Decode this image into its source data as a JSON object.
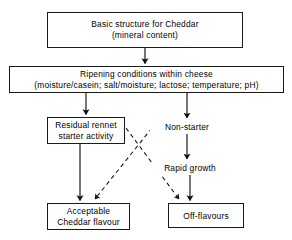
{
  "diagram": {
    "background_color": "#ffffff",
    "line_color": "#1a1a1a",
    "text_color": "#000000",
    "nodes": [
      {
        "id": "basic-structure",
        "line1": "Basic structure for Cheddar",
        "line2": "(mineral content)",
        "boxed": true
      },
      {
        "id": "ripening-conditions",
        "line1": "Ripening conditions within cheese",
        "line2": "(moisture/casein; salt/moisture; lactose; temperature; pH)",
        "boxed": true
      },
      {
        "id": "residual-rennet",
        "line1": "Residual rennet",
        "line2": "starter activity",
        "boxed": true
      },
      {
        "id": "non-starter",
        "line1": "Non-starter",
        "boxed": false
      },
      {
        "id": "rapid-growth",
        "line1": "Rapid growth",
        "boxed": false
      },
      {
        "id": "acceptable-flavour",
        "line1": "Acceptable",
        "line2": "Cheddar flavour",
        "boxed": true
      },
      {
        "id": "off-flavours",
        "line1": "Off-flavours",
        "boxed": true
      }
    ],
    "edges": [
      {
        "id": "basic-to-ripening",
        "from": "basic-structure",
        "to": "ripening-conditions",
        "style": "solid"
      },
      {
        "id": "ripening-to-residual",
        "from": "ripening-conditions",
        "to": "residual-rennet",
        "style": "solid"
      },
      {
        "id": "ripening-to-nonstarter",
        "from": "ripening-conditions",
        "to": "non-starter",
        "style": "solid"
      },
      {
        "id": "nonstarter-to-rapidgrowth",
        "from": "non-starter",
        "to": "rapid-growth",
        "style": "solid"
      },
      {
        "id": "residual-to-acceptable",
        "from": "residual-rennet",
        "to": "acceptable-flavour",
        "style": "solid"
      },
      {
        "id": "rapidgrowth-to-offflavours",
        "from": "rapid-growth",
        "to": "off-flavours",
        "style": "solid"
      },
      {
        "id": "residual-to-offflavours",
        "from": "residual-rennet",
        "to": "off-flavours",
        "style": "dashed"
      },
      {
        "id": "nonstarter-to-acceptable",
        "from": "non-starter",
        "to": "acceptable-flavour",
        "style": "dashed"
      }
    ]
  }
}
